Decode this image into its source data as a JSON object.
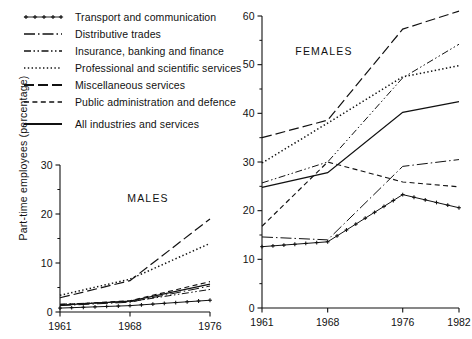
{
  "figure": {
    "ylabel": "Part-time employees (percentage)",
    "panels": [
      "MALES",
      "FEMALES"
    ]
  },
  "legend": {
    "position": "top-left",
    "items": [
      {
        "label": "Transport and communication",
        "style": "solid-with-plus-markers",
        "key": "plus"
      },
      {
        "label": "Distributive trades",
        "style": "long-dash-dot",
        "key": "longdashdot"
      },
      {
        "label": "Insurance, banking and finance",
        "style": "dash-dot-dot",
        "key": "dashdotdot"
      },
      {
        "label": "Professional and scientific services",
        "style": "dotted",
        "key": "dotted"
      },
      {
        "label": "Miscellaneous services",
        "style": "long-dash",
        "key": "longdash"
      },
      {
        "label": "Public administration and defence",
        "style": "dashed",
        "key": "dashed"
      },
      {
        "label": "All industries and services",
        "style": "solid",
        "key": "solid"
      }
    ]
  },
  "chart_data": [
    {
      "type": "line",
      "title": "MALES",
      "xlabel": "",
      "ylabel": "Part-time employees (percentage)",
      "x": [
        1961,
        1968,
        1976
      ],
      "xticks": [
        "1961",
        "1968",
        "1976"
      ],
      "xlim": [
        1961,
        1976
      ],
      "yticks": [
        0,
        10,
        20,
        30
      ],
      "ylim": [
        0,
        30
      ],
      "grid": false,
      "series": [
        {
          "name": "Transport and communication",
          "key": "plus",
          "values": [
            0.8,
            1.3,
            2.4
          ]
        },
        {
          "name": "Distributive trades",
          "key": "longdashdot",
          "values": [
            1.3,
            2.0,
            5.3
          ]
        },
        {
          "name": "Insurance, banking and finance",
          "key": "dashdotdot",
          "values": [
            1.6,
            2.1,
            4.6
          ]
        },
        {
          "name": "Professional and scientific services",
          "key": "dotted",
          "values": [
            3.4,
            6.7,
            14.0
          ]
        },
        {
          "name": "Miscellaneous services",
          "key": "longdash",
          "values": [
            2.9,
            6.4,
            19.0
          ]
        },
        {
          "name": "Public administration and defence",
          "key": "dashed",
          "values": [
            1.5,
            2.3,
            6.2
          ]
        },
        {
          "name": "All industries and services",
          "key": "solid",
          "values": [
            1.4,
            2.2,
            5.7
          ]
        }
      ]
    },
    {
      "type": "line",
      "title": "FEMALES",
      "xlabel": "",
      "ylabel": "Part-time employees (percentage)",
      "x": [
        1961,
        1968,
        1976,
        1982
      ],
      "xticks": [
        "1961",
        "1968",
        "1976",
        "1982"
      ],
      "xlim": [
        1961,
        1982
      ],
      "yticks": [
        0,
        10,
        20,
        30,
        40,
        50,
        60
      ],
      "ylim": [
        0,
        60
      ],
      "grid": false,
      "series": [
        {
          "name": "Transport and communication",
          "key": "plus",
          "values": [
            12.6,
            13.6,
            23.3,
            20.6
          ]
        },
        {
          "name": "Distributive trades",
          "key": "longdashdot",
          "values": [
            14.6,
            14.0,
            29.1,
            30.5
          ]
        },
        {
          "name": "Insurance, banking and finance",
          "key": "dashdotdot",
          "values": [
            25.7,
            30.0,
            47.3,
            54.2
          ]
        },
        {
          "name": "Professional and scientific services",
          "key": "dotted",
          "values": [
            29.8,
            38.0,
            47.5,
            49.8
          ]
        },
        {
          "name": "Miscellaneous services",
          "key": "longdash",
          "values": [
            35.0,
            38.6,
            57.3,
            61.0
          ]
        },
        {
          "name": "Public administration and defence",
          "key": "dashed",
          "values": [
            16.8,
            30.0,
            25.9,
            24.9
          ]
        },
        {
          "name": "All industries and services",
          "key": "solid",
          "values": [
            24.8,
            27.8,
            40.2,
            42.4
          ]
        }
      ]
    }
  ],
  "colors": {
    "ink": "#111111",
    "background": "#ffffff"
  }
}
